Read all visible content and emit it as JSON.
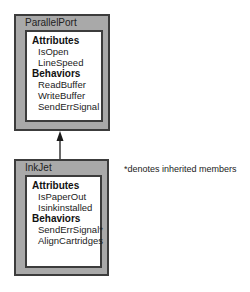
{
  "diagram": {
    "type": "uml-class-inheritance",
    "classes": [
      {
        "name": "ParallelPort",
        "sections": [
          {
            "heading": "Attributes",
            "members": [
              "IsOpen",
              "LineSpeed"
            ]
          },
          {
            "heading": "Behaviors",
            "members": [
              "ReadBuffer",
              "WriteBuffer",
              "SendErrSignal"
            ]
          }
        ]
      },
      {
        "name": "InkJet",
        "sections": [
          {
            "heading": "Attributes",
            "members": [
              "IsPaperOut",
              "Isinkinstalled"
            ]
          },
          {
            "heading": "Behaviors",
            "members": [
              "SendErrSignal*",
              "AlignCartridges"
            ]
          }
        ]
      }
    ],
    "relationships": [
      {
        "from": "InkJet",
        "to": "ParallelPort",
        "kind": "inheritance-arrow"
      }
    ],
    "note": "*denotes inherited members"
  },
  "colors": {
    "box_fill": "#a9a9a9",
    "border": "#3c3c3c",
    "panel": "#ffffff"
  }
}
